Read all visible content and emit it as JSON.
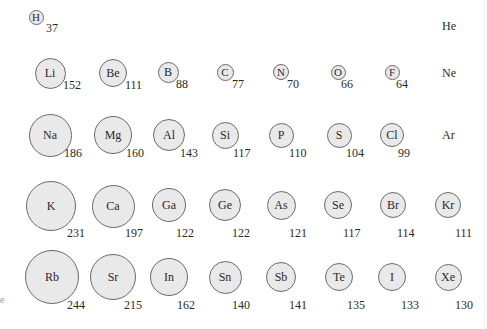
{
  "diagram": {
    "unit": "pm",
    "columns_x": [
      49,
      113,
      169,
      225,
      281,
      339,
      393,
      448
    ],
    "rows_y": [
      17,
      73,
      135,
      205,
      276
    ],
    "fill_color": "#e9e9e9",
    "stroke_color": "#6a6a6a",
    "left_edge_mark": "e"
  },
  "elements": [
    {
      "symbol": "H",
      "radius": "37",
      "row": 0,
      "col": 0,
      "size": 15,
      "cx": 36,
      "cy": 17,
      "vx": 46,
      "vy": 28
    },
    {
      "symbol": "Li",
      "radius": "152",
      "row": 1,
      "col": 0,
      "size": 31,
      "cx": 50,
      "cy": 73,
      "vx": 63,
      "vy": 85
    },
    {
      "symbol": "Be",
      "radius": "111",
      "row": 1,
      "col": 1,
      "size": 28,
      "cx": 113,
      "cy": 73,
      "vx": 125,
      "vy": 85
    },
    {
      "symbol": "B",
      "radius": "88",
      "row": 1,
      "col": 2,
      "size": 21,
      "cx": 168,
      "cy": 72,
      "vx": 176,
      "vy": 84
    },
    {
      "symbol": "C",
      "radius": "77",
      "row": 1,
      "col": 3,
      "size": 17,
      "cx": 225,
      "cy": 72,
      "vx": 232,
      "vy": 84
    },
    {
      "symbol": "N",
      "radius": "70",
      "row": 1,
      "col": 4,
      "size": 16,
      "cx": 281,
      "cy": 72,
      "vx": 287,
      "vy": 84
    },
    {
      "symbol": "O",
      "radius": "66",
      "row": 1,
      "col": 5,
      "size": 15,
      "cx": 338,
      "cy": 72,
      "vx": 341,
      "vy": 84
    },
    {
      "symbol": "F",
      "radius": "64",
      "row": 1,
      "col": 6,
      "size": 15,
      "cx": 392,
      "cy": 72,
      "vx": 396,
      "vy": 84
    },
    {
      "symbol": "Na",
      "radius": "186",
      "row": 2,
      "col": 0,
      "size": 43,
      "cx": 50,
      "cy": 135,
      "vx": 64,
      "vy": 153
    },
    {
      "symbol": "Mg",
      "radius": "160",
      "row": 2,
      "col": 1,
      "size": 38,
      "cx": 113,
      "cy": 135,
      "vx": 126,
      "vy": 153
    },
    {
      "symbol": "Al",
      "radius": "143",
      "row": 2,
      "col": 2,
      "size": 32,
      "cx": 169,
      "cy": 135,
      "vx": 180,
      "vy": 153
    },
    {
      "symbol": "Si",
      "radius": "117",
      "row": 2,
      "col": 3,
      "size": 27,
      "cx": 225,
      "cy": 135,
      "vx": 233,
      "vy": 153
    },
    {
      "symbol": "P",
      "radius": "110",
      "row": 2,
      "col": 4,
      "size": 25,
      "cx": 281,
      "cy": 135,
      "vx": 289,
      "vy": 153
    },
    {
      "symbol": "S",
      "radius": "104",
      "row": 2,
      "col": 5,
      "size": 25,
      "cx": 339,
      "cy": 135,
      "vx": 346,
      "vy": 153
    },
    {
      "symbol": "Cl",
      "radius": "99",
      "row": 2,
      "col": 6,
      "size": 24,
      "cx": 392,
      "cy": 135,
      "vx": 398,
      "vy": 153
    },
    {
      "symbol": "K",
      "radius": "231",
      "row": 3,
      "col": 0,
      "size": 50,
      "cx": 51,
      "cy": 206,
      "vx": 67,
      "vy": 233
    },
    {
      "symbol": "Ca",
      "radius": "197",
      "row": 3,
      "col": 1,
      "size": 43,
      "cx": 113,
      "cy": 206,
      "vx": 125,
      "vy": 233
    },
    {
      "symbol": "Ga",
      "radius": "122",
      "row": 3,
      "col": 2,
      "size": 34,
      "cx": 169,
      "cy": 205,
      "vx": 176,
      "vy": 233
    },
    {
      "symbol": "Ge",
      "radius": "122",
      "row": 3,
      "col": 3,
      "size": 32,
      "cx": 225,
      "cy": 205,
      "vx": 232,
      "vy": 233
    },
    {
      "symbol": "As",
      "radius": "121",
      "row": 3,
      "col": 4,
      "size": 29,
      "cx": 281,
      "cy": 205,
      "vx": 289,
      "vy": 233
    },
    {
      "symbol": "Se",
      "radius": "117",
      "row": 3,
      "col": 5,
      "size": 28,
      "cx": 338,
      "cy": 205,
      "vx": 343,
      "vy": 233
    },
    {
      "symbol": "Br",
      "radius": "114",
      "row": 3,
      "col": 6,
      "size": 26,
      "cx": 393,
      "cy": 205,
      "vx": 397,
      "vy": 233
    },
    {
      "symbol": "Kr",
      "radius": "111",
      "row": 3,
      "col": 7,
      "size": 26,
      "cx": 448,
      "cy": 205,
      "vx": 455,
      "vy": 233
    },
    {
      "symbol": "Rb",
      "radius": "244",
      "row": 4,
      "col": 0,
      "size": 54,
      "cx": 52,
      "cy": 277,
      "vx": 67,
      "vy": 305
    },
    {
      "symbol": "Sr",
      "radius": "215",
      "row": 4,
      "col": 1,
      "size": 46,
      "cx": 113,
      "cy": 277,
      "vx": 124,
      "vy": 305
    },
    {
      "symbol": "In",
      "radius": "162",
      "row": 4,
      "col": 2,
      "size": 38,
      "cx": 169,
      "cy": 277,
      "vx": 177,
      "vy": 305
    },
    {
      "symbol": "Sn",
      "radius": "140",
      "row": 4,
      "col": 3,
      "size": 33,
      "cx": 225,
      "cy": 277,
      "vx": 232,
      "vy": 305
    },
    {
      "symbol": "Sb",
      "radius": "141",
      "row": 4,
      "col": 4,
      "size": 30,
      "cx": 281,
      "cy": 277,
      "vx": 289,
      "vy": 305
    },
    {
      "symbol": "Te",
      "radius": "135",
      "row": 4,
      "col": 5,
      "size": 28,
      "cx": 339,
      "cy": 277,
      "vx": 347,
      "vy": 305
    },
    {
      "symbol": "I",
      "radius": "133",
      "row": 4,
      "col": 6,
      "size": 28,
      "cx": 392,
      "cy": 277,
      "vx": 401,
      "vy": 305
    },
    {
      "symbol": "Xe",
      "radius": "130",
      "row": 4,
      "col": 7,
      "size": 27,
      "cx": 448,
      "cy": 277,
      "vx": 455,
      "vy": 305
    }
  ],
  "noble_gases_labels_only": [
    {
      "symbol": "He",
      "x": 442,
      "y": 20
    },
    {
      "symbol": "Ne",
      "x": 442,
      "y": 67
    },
    {
      "symbol": "Ar",
      "x": 442,
      "y": 129
    }
  ]
}
